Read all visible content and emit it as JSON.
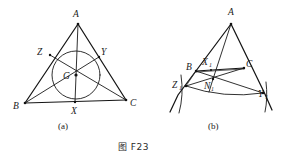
{
  "figure": {
    "caption": "图 F23",
    "panels": [
      {
        "id": "a",
        "sublabel": "(a)",
        "description": "Triangle ABC with incircle, cevians through interior point G meeting sides at X, Y, Z",
        "vertices": [
          {
            "label": "A",
            "x": 78,
            "y": 24,
            "label_x": 73,
            "label_y": 17
          },
          {
            "label": "B",
            "x": 25,
            "y": 103,
            "label_x": 13,
            "label_y": 109
          },
          {
            "label": "C",
            "x": 126,
            "y": 100,
            "label_x": 130,
            "label_y": 106
          }
        ],
        "points": [
          {
            "label": "X",
            "x": 75,
            "y": 102,
            "label_x": 71,
            "label_y": 113
          },
          {
            "label": "Y",
            "x": 99,
            "y": 57,
            "label_x": 101,
            "label_y": 54
          },
          {
            "label": "Z",
            "x": 50,
            "y": 55,
            "label_x": 37,
            "label_y": 54
          },
          {
            "label": "G",
            "x": 76,
            "y": 75,
            "label_x": 64,
            "label_y": 79
          }
        ],
        "incircle": {
          "cx": 76,
          "cy": 75,
          "r": 24
        }
      },
      {
        "id": "b",
        "sublabel": "(b)",
        "description": "Triangle ABC with excircle arcs, cevians through N1 meeting extensions at X1, Y1, Z1",
        "vertices": [
          {
            "label": "A",
            "x": 231,
            "y": 24,
            "label_x": 228,
            "label_y": 15
          },
          {
            "label": "B",
            "x": 197,
            "y": 71,
            "label_x": 188,
            "label_y": 70
          },
          {
            "label": "C",
            "x": 243,
            "y": 69,
            "label_x": 246,
            "label_y": 67
          }
        ],
        "points": [
          {
            "label": "X",
            "sub": "1",
            "x": 211,
            "y": 70,
            "label_x": 202,
            "label_y": 65
          },
          {
            "label": "Y",
            "sub": "1",
            "x": 263,
            "y": 94,
            "label_x": 260,
            "label_y": 94
          },
          {
            "label": "Z",
            "sub": "1",
            "x": 186,
            "y": 86,
            "label_x": 174,
            "label_y": 86
          },
          {
            "label": "N",
            "sub": "1",
            "x": 213,
            "y": 79,
            "label_x": 206,
            "label_y": 88
          }
        ]
      }
    ]
  }
}
